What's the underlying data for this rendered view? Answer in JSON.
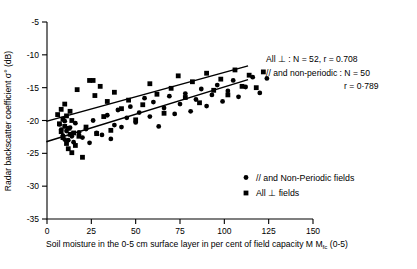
{
  "chart_data": {
    "type": "scatter",
    "title": "",
    "xlabel": "Soil moisture in the 0-5 cm surface layer in per cent of field capacity Mfc (0-5)",
    "ylabel": "Radar backscatter coefficient σ° (dB)",
    "xlim": [
      0,
      150
    ],
    "ylim": [
      -35,
      -5
    ],
    "xticks": [
      "0",
      "25",
      "50",
      "75",
      "100",
      "125",
      "150"
    ],
    "xtick_values": [
      0,
      25,
      50,
      75,
      100,
      125,
      150
    ],
    "yticks": [
      "-5",
      "-10",
      "-15",
      "-20",
      "-25",
      "-30",
      "-35"
    ],
    "ytick_values": [
      -5,
      -10,
      -15,
      -20,
      -25,
      -30,
      -35
    ],
    "grid": false,
    "legend_position": "lower-right",
    "series": [
      {
        "name": "// and Non-Periodic fields",
        "marker": "circle",
        "color": "#000000",
        "n": 50,
        "r": 0.789,
        "points": [
          [
            7,
            -20.6
          ],
          [
            8,
            -21.4
          ],
          [
            9,
            -22.3
          ],
          [
            10,
            -20.1
          ],
          [
            10,
            -22.9
          ],
          [
            11,
            -21.6
          ],
          [
            12,
            -23.0
          ],
          [
            13,
            -21.1
          ],
          [
            14,
            -22.4
          ],
          [
            15,
            -23.3
          ],
          [
            16,
            -20.4
          ],
          [
            18,
            -21.8
          ],
          [
            20,
            -22.6
          ],
          [
            22,
            -21.3
          ],
          [
            24,
            -23.4
          ],
          [
            26,
            -20.0
          ],
          [
            28,
            -21.9
          ],
          [
            31,
            -22.2
          ],
          [
            34,
            -19.2
          ],
          [
            36,
            -22.8
          ],
          [
            38,
            -20.7
          ],
          [
            40,
            -18.4
          ],
          [
            42,
            -21.0
          ],
          [
            45,
            -19.6
          ],
          [
            47,
            -17.9
          ],
          [
            50,
            -20.3
          ],
          [
            52,
            -18.8
          ],
          [
            55,
            -16.6
          ],
          [
            58,
            -19.4
          ],
          [
            60,
            -17.2
          ],
          [
            63,
            -20.9
          ],
          [
            66,
            -18.1
          ],
          [
            69,
            -16.3
          ],
          [
            72,
            -19.0
          ],
          [
            75,
            -17.5
          ],
          [
            78,
            -15.9
          ],
          [
            81,
            -18.6
          ],
          [
            84,
            -16.8
          ],
          [
            87,
            -15.2
          ],
          [
            90,
            -17.8
          ],
          [
            93,
            -16.1
          ],
          [
            96,
            -14.6
          ],
          [
            99,
            -17.1
          ],
          [
            102,
            -15.5
          ],
          [
            105,
            -13.9
          ],
          [
            108,
            -16.4
          ],
          [
            112,
            -14.9
          ],
          [
            116,
            -13.4
          ],
          [
            120,
            -15.8
          ],
          [
            124,
            -13.6
          ]
        ]
      },
      {
        "name": "All ⊥ fields",
        "marker": "square",
        "color": "#000000",
        "n": 52,
        "r": 0.708,
        "points": [
          [
            6,
            -19.1
          ],
          [
            7,
            -20.5
          ],
          [
            8,
            -18.3
          ],
          [
            8,
            -21.7
          ],
          [
            9,
            -19.8
          ],
          [
            9,
            -22.6
          ],
          [
            10,
            -17.5
          ],
          [
            10,
            -20.9
          ],
          [
            11,
            -23.5
          ],
          [
            11,
            -19.3
          ],
          [
            12,
            -21.2
          ],
          [
            12,
            -24.3
          ],
          [
            13,
            -18.6
          ],
          [
            13,
            -22.1
          ],
          [
            14,
            -20.0
          ],
          [
            14,
            -24.9
          ],
          [
            15,
            -21.9
          ],
          [
            16,
            -23.8
          ],
          [
            17,
            -15.3
          ],
          [
            18,
            -22.4
          ],
          [
            20,
            -25.6
          ],
          [
            22,
            -21.0
          ],
          [
            24,
            -13.9
          ],
          [
            26,
            -13.9
          ],
          [
            27,
            -16.2
          ],
          [
            28,
            -22.0
          ],
          [
            30,
            -14.8
          ],
          [
            32,
            -19.4
          ],
          [
            34,
            -17.1
          ],
          [
            36,
            -21.5
          ],
          [
            38,
            -15.7
          ],
          [
            42,
            -18.2
          ],
          [
            46,
            -16.9
          ],
          [
            50,
            -19.9
          ],
          [
            54,
            -17.6
          ],
          [
            58,
            -14.4
          ],
          [
            62,
            -16.0
          ],
          [
            66,
            -18.9
          ],
          [
            70,
            -15.1
          ],
          [
            74,
            -13.2
          ],
          [
            78,
            -16.5
          ],
          [
            82,
            -14.1
          ],
          [
            86,
            -17.3
          ],
          [
            90,
            -12.8
          ],
          [
            94,
            -15.4
          ],
          [
            98,
            -13.7
          ],
          [
            102,
            -16.1
          ],
          [
            106,
            -12.3
          ],
          [
            110,
            -14.8
          ],
          [
            114,
            -13.1
          ],
          [
            118,
            -15.0
          ],
          [
            122,
            -12.6
          ]
        ]
      }
    ],
    "fit_lines": [
      {
        "name": "All ⊥ regression",
        "x0": 0,
        "y0": -20.1,
        "x1": 113,
        "y1": -11.7
      },
      {
        "name": "// and non-periodic regression",
        "x0": 0,
        "y0": -23.2,
        "x1": 113,
        "y1": -13.8
      }
    ],
    "annotations": [
      {
        "id": "annot-perp",
        "text": "All ⊥ : N = 52, r = 0.708"
      },
      {
        "id": "annot-par",
        "text": "// and non-periodic : N = 50"
      },
      {
        "id": "annot-par-r",
        "text": "r = 0·789"
      }
    ],
    "legend_entries": [
      {
        "marker": "circle",
        "label": "// and Non-Periodic fields"
      },
      {
        "marker": "square",
        "label": "All ⊥ fields"
      }
    ]
  }
}
